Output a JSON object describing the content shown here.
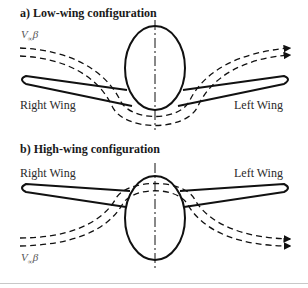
{
  "panels": [
    {
      "id": "a",
      "title": "a) Low-wing configuration",
      "right_wing_label": "Right Wing",
      "left_wing_label": "Left Wing",
      "flow_label": {
        "symbol": "V",
        "subscript": "∞",
        "suffix": "β"
      }
    },
    {
      "id": "b",
      "title": "b) High-wing configuration",
      "right_wing_label": "Right Wing",
      "left_wing_label": "Left Wing",
      "flow_label": {
        "symbol": "V",
        "subscript": "∞",
        "suffix": "β"
      }
    }
  ],
  "colors": {
    "line": "#111111",
    "text": "#222222",
    "rule": "#c8c8c8"
  }
}
